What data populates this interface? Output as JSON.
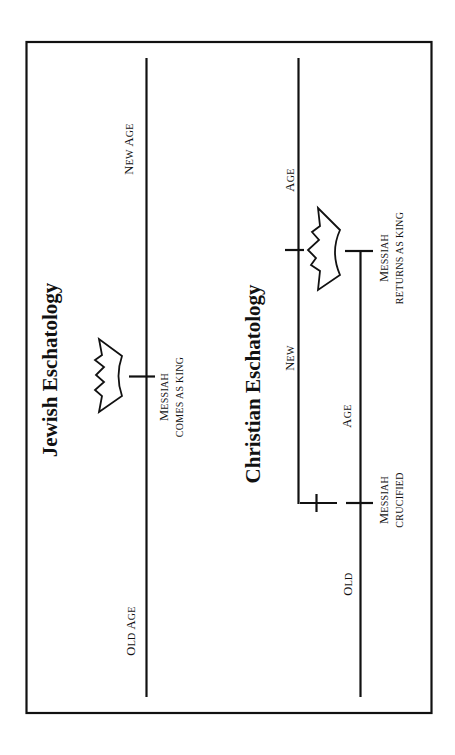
{
  "diagram": {
    "orientation": "rotated-90-ccw",
    "jewish": {
      "title": "Jewish Eschatology",
      "timeline_labels": {
        "new_age": {
          "first": "N",
          "rest": "EW ",
          "first2": "A",
          "rest2": "GE"
        },
        "old_age": {
          "first": "O",
          "rest": "LD ",
          "first2": "A",
          "rest2": "GE"
        }
      },
      "event": {
        "line1": {
          "first": "M",
          "rest": "ESSIAH"
        },
        "line2": "COMES AS KING",
        "icon": "crown-icon"
      }
    },
    "christian": {
      "title": "Christian Eschatology",
      "new_age_labels": {
        "new": {
          "first": "N",
          "rest": "EW"
        },
        "age": {
          "first": "A",
          "rest": "GE"
        }
      },
      "old_age_labels": {
        "old": {
          "first": "O",
          "rest": "LD"
        },
        "age": {
          "first": "A",
          "rest": "GE"
        }
      },
      "events": [
        {
          "line1": {
            "first": "M",
            "rest": "ESSIAH"
          },
          "line2": "RETURNS AS KING",
          "icon": "crown-icon"
        },
        {
          "line1": {
            "first": "M",
            "rest": "ESSIAH"
          },
          "line2": "CRUCIFIED",
          "icon": "cross-icon"
        }
      ]
    }
  }
}
